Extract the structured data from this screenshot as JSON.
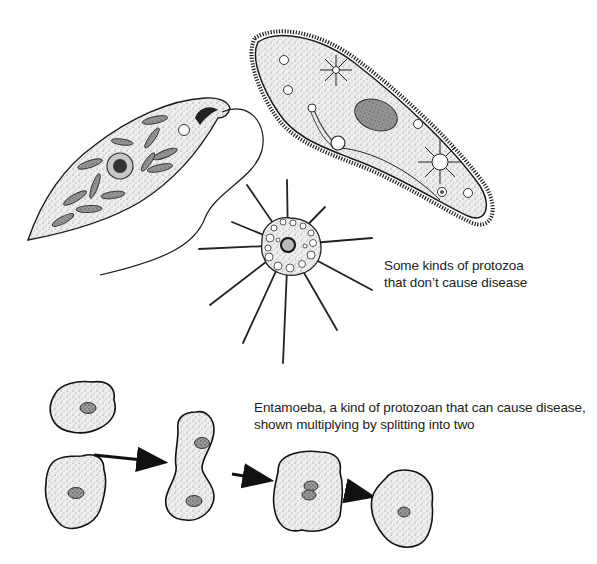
{
  "captions": {
    "non_disease": {
      "line1": "Some kinds of protozoa",
      "line2": "that don’t cause disease"
    },
    "entamoeba": {
      "line1": "Entamoeba, a kind of protozoan that can cause disease,",
      "line2": "shown multiplying by splitting into two"
    }
  },
  "organisms": [
    {
      "name": "euglena-like flagellate",
      "position": "top-left"
    },
    {
      "name": "paramecium (ciliate)",
      "position": "top-right"
    },
    {
      "name": "heliozoan (sun animalcule)",
      "position": "center"
    },
    {
      "name": "entamoeba division sequence",
      "position": "bottom",
      "stages": 4
    }
  ],
  "colors": {
    "ink": "#1a1a1a",
    "stipple_fill": "#e4e4e4",
    "nucleus": "#8a8a8a",
    "background": "#ffffff"
  }
}
